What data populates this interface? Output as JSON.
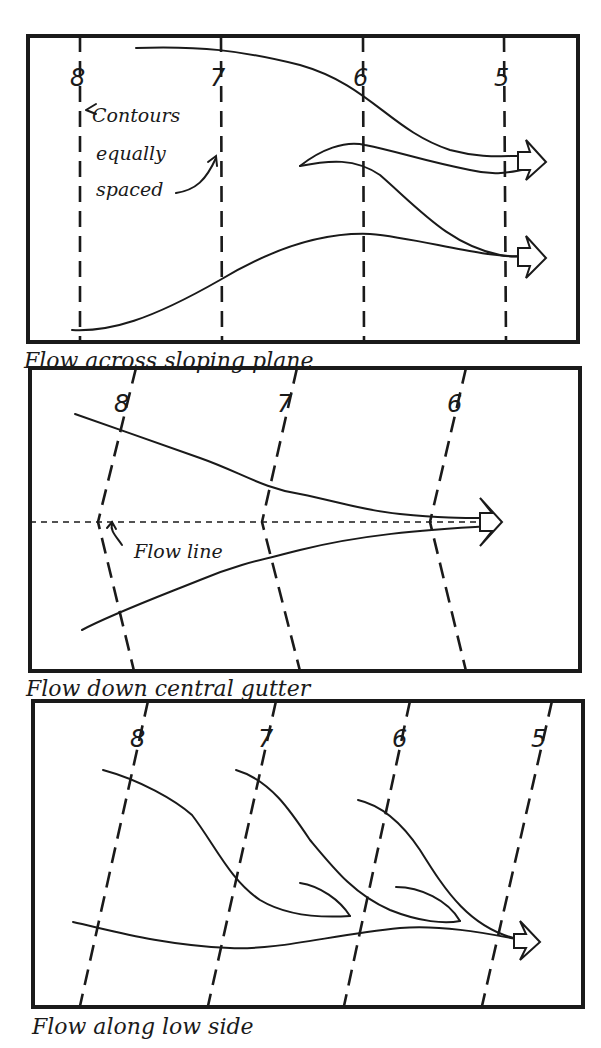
{
  "panels": [
    {
      "caption": "Flow across sloping plane",
      "contour_labels": [
        "8",
        "7",
        "6",
        "5"
      ],
      "annotation": [
        "Contours",
        "equally",
        "spaced"
      ]
    },
    {
      "caption": "Flow down central gutter",
      "contour_labels": [
        "8",
        "7",
        "6"
      ],
      "annotation": [
        "Flow line"
      ]
    },
    {
      "caption": "Flow along low side",
      "contour_labels": [
        "8",
        "7",
        "6",
        "5"
      ]
    }
  ]
}
